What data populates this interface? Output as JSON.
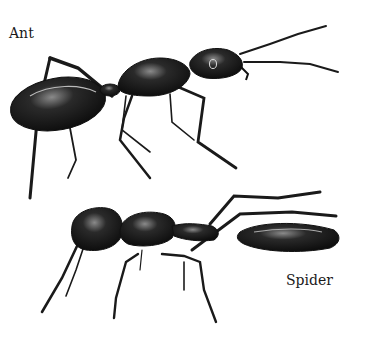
{
  "labels": {
    "ant": "Ant",
    "spider": "Spider"
  },
  "illustrations": [
    {
      "subject": "ant",
      "description": "black ant, side view, facing right"
    },
    {
      "subject": "spider",
      "description": "ant-mimicking spider, side view, facing left"
    }
  ],
  "colors": {
    "background": "#ffffff",
    "body": "#1c1c1c",
    "highlight": "#9a9a9a"
  }
}
